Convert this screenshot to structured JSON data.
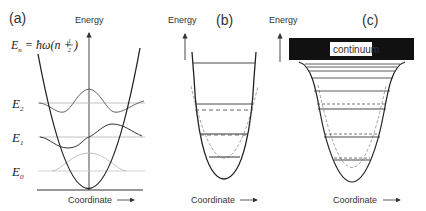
{
  "panels": {
    "a": {
      "tag": "(a)",
      "y_axis_label": "Energy",
      "x_axis_label": "Coordinate",
      "formula": "E_n = ħω(n + ½)",
      "formula_parts": {
        "lhs": "E",
        "sub": "n",
        "eq": " = ħω(n + ",
        "frac_num": "1",
        "frac_den": "2",
        "close": ")"
      },
      "levels": [
        {
          "name": "E",
          "sub": "2"
        },
        {
          "name": "E",
          "sub": "1"
        },
        {
          "name": "E",
          "sub": "0"
        }
      ]
    },
    "b": {
      "tag": "(b)",
      "y_axis_label": "Energy",
      "x_axis_label": "Coordinate"
    },
    "c": {
      "tag": "(c)",
      "y_axis_label": "Energy",
      "x_axis_label": "Coordinate",
      "continuum_label": "continuum"
    }
  },
  "colors": {
    "line": "#222222",
    "level_light": "#bbbbbb",
    "wave_light": "#aaaaaa",
    "dashed": "#666666",
    "continuum_bg": "#111111"
  }
}
